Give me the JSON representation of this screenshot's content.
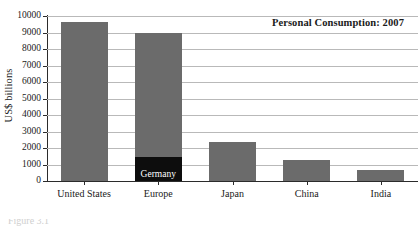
{
  "chart_data": {
    "type": "bar",
    "title": "Personal Consumption: 2007",
    "xlabel": "",
    "ylabel": "US$ billions",
    "ylim": [
      0,
      10000
    ],
    "ytick_step": 1000,
    "grid": true,
    "legend": "none",
    "categories": [
      "United States",
      "Europe",
      "Japan",
      "China",
      "India"
    ],
    "values": [
      9650,
      8950,
      2350,
      1250,
      650
    ],
    "ytick_labels": [
      "0",
      "1000",
      "2000",
      "3000",
      "4000",
      "5000",
      "6000",
      "7000",
      "8000",
      "9000",
      "10000"
    ],
    "ytick_values": [
      0,
      1000,
      2000,
      3000,
      4000,
      5000,
      6000,
      7000,
      8000,
      9000,
      10000
    ],
    "series": [
      {
        "name": "Personal Consumption",
        "values": [
          9650,
          8950,
          2350,
          1250,
          650
        ]
      }
    ],
    "annotations": [
      {
        "label": "Germany",
        "category": "Europe",
        "value": 1450,
        "note": "black sub-segment inside the Europe bar"
      }
    ],
    "colors": {
      "bar": "#6b6b6b",
      "sub_bar": "#0d0d0d",
      "gridline": "#b9b9b9",
      "axis": "#2b2b2b",
      "background": "#ffffff",
      "sub_bar_label": "#ffffff"
    }
  },
  "caption": {
    "cut_off_text": "Figure 3.1"
  }
}
